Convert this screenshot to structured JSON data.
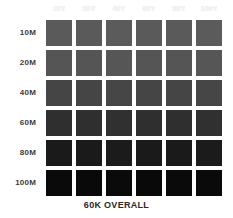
{
  "chart_data": {
    "type": "heatmap",
    "title": "",
    "caption": "60K OVERALL",
    "xlabel": "",
    "ylabel": "",
    "x_tick_labels": [
      "10Y",
      "20Y",
      "40Y",
      "60Y",
      "80Y",
      "100Y"
    ],
    "y_tick_labels": [
      "10M",
      "20M",
      "40M",
      "60M",
      "80M",
      "100M"
    ],
    "categories": [
      "10Y",
      "20Y",
      "40Y",
      "60Y",
      "80Y",
      "100Y"
    ],
    "grid": false,
    "legend": "none",
    "series": [
      {
        "name": "10M",
        "values": [
          "#5a5a5a",
          "#5a5a5a",
          "#5b5b5b",
          "#5a5a5a",
          "#5a5a5a",
          "#5b5b5b"
        ]
      },
      {
        "name": "20M",
        "values": [
          "#555555",
          "#555555",
          "#565656",
          "#555555",
          "#555555",
          "#565656"
        ]
      },
      {
        "name": "40M",
        "values": [
          "#454545",
          "#454545",
          "#464646",
          "#454545",
          "#454545",
          "#464646"
        ]
      },
      {
        "name": "60M",
        "values": [
          "#2f2f2f",
          "#2f2f2f",
          "#303030",
          "#2f2f2f",
          "#2f2f2f",
          "#303030"
        ]
      },
      {
        "name": "80M",
        "values": [
          "#1a1a1a",
          "#1a1a1a",
          "#1b1b1b",
          "#1a1a1a",
          "#1a1a1a",
          "#1b1b1b"
        ]
      },
      {
        "name": "100M",
        "values": [
          "#0a0a0a",
          "#090909",
          "#0a0a0a",
          "#090909",
          "#0a0a0a",
          "#0a0a0a"
        ]
      }
    ]
  },
  "colors": {
    "background": "#ffffff",
    "row_label_text": "#3b3b3b",
    "col_header_text": "#f4f4f4",
    "caption_text": "#2a2a2a"
  }
}
